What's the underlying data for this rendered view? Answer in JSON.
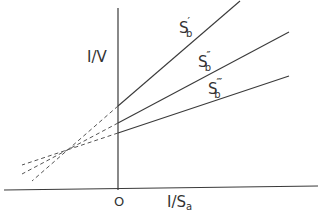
{
  "diagram": {
    "y_axis_label": "I/V",
    "x_axis_label_main": "I/S",
    "x_axis_label_sub": "a",
    "origin_label": "O",
    "lines": [
      {
        "name": "S'b",
        "label_main": "S",
        "label_sub": "b",
        "label_prime": "′"
      },
      {
        "name": "S''b",
        "label_main": "S",
        "label_sub": "b",
        "label_prime": "″"
      },
      {
        "name": "S'''b",
        "label_main": "S",
        "label_sub": "b",
        "label_prime": "‴"
      }
    ],
    "line_color": "#3a3a3a",
    "background": "#ffffff"
  }
}
